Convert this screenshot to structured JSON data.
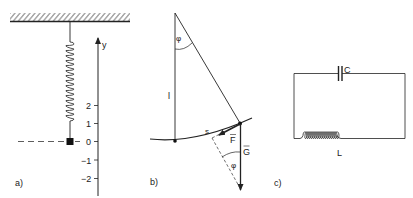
{
  "panels": {
    "a": {
      "label": "a)",
      "axis_label": "y",
      "ticks": [
        "2",
        "1",
        "0",
        "−1",
        "−2"
      ]
    },
    "b": {
      "label": "b)",
      "angle_top": "φ",
      "angle_bottom": "φ",
      "length_label": "l",
      "arc_label": "s",
      "force_label": "F",
      "gravity_label": "G"
    },
    "c": {
      "label": "c)",
      "capacitor_label": "C",
      "inductor_label": "L"
    }
  },
  "colors": {
    "ink": "#222222",
    "background": "#ffffff"
  }
}
